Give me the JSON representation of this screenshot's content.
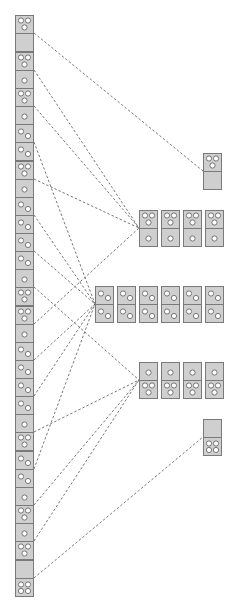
{
  "diagram": {
    "colors": {
      "domino_fill": "#cfcfcf",
      "domino_stroke": "#7a7a7a",
      "pip": "#ffffff",
      "edge": "#555555"
    },
    "domino_size": {
      "w": 18,
      "h": 36
    },
    "left_column": {
      "x": 15,
      "dominoes": [
        {
          "y": 15,
          "top": 3,
          "bottom": 0,
          "group": "g30"
        },
        {
          "y": 52,
          "top": 3,
          "bottom": 1,
          "group": "g31"
        },
        {
          "y": 88,
          "top": 3,
          "bottom": 1,
          "group": "g31"
        },
        {
          "y": 124,
          "top": 2,
          "bottom": 2,
          "group": "g22"
        },
        {
          "y": 161,
          "top": 3,
          "bottom": 1,
          "group": "g31"
        },
        {
          "y": 197,
          "top": 2,
          "bottom": 2,
          "group": "g22"
        },
        {
          "y": 233,
          "top": 2,
          "bottom": 2,
          "group": "g22"
        },
        {
          "y": 269,
          "top": 1,
          "bottom": 3,
          "group": "g13"
        },
        {
          "y": 306,
          "top": 3,
          "bottom": 1,
          "group": "g31"
        },
        {
          "y": 342,
          "top": 2,
          "bottom": 2,
          "group": "g22"
        },
        {
          "y": 378,
          "top": 2,
          "bottom": 2,
          "group": "g22"
        },
        {
          "y": 414,
          "top": 1,
          "bottom": 3,
          "group": "g13"
        },
        {
          "y": 451,
          "top": 2,
          "bottom": 2,
          "group": "g22"
        },
        {
          "y": 487,
          "top": 1,
          "bottom": 3,
          "group": "g13"
        },
        {
          "y": 523,
          "top": 1,
          "bottom": 3,
          "group": "g13"
        },
        {
          "y": 560,
          "top": 0,
          "bottom": 4,
          "group": "g04"
        }
      ]
    },
    "groups": [
      {
        "id": "g30",
        "label": "3|0",
        "x": 203,
        "y": 153,
        "count": 1,
        "top": 3,
        "bottom": 0
      },
      {
        "id": "g31",
        "label": "3|1",
        "x": 139,
        "y": 210,
        "count": 4,
        "top": 3,
        "bottom": 1
      },
      {
        "id": "g22",
        "label": "2|2",
        "x": 95,
        "y": 286,
        "count": 6,
        "top": 2,
        "bottom": 2
      },
      {
        "id": "g13",
        "label": "1|3",
        "x": 139,
        "y": 362,
        "count": 4,
        "top": 1,
        "bottom": 3
      },
      {
        "id": "g04",
        "label": "0|4",
        "x": 203,
        "y": 419,
        "count": 1,
        "top": 0,
        "bottom": 4
      }
    ],
    "group_pitch": 22
  }
}
